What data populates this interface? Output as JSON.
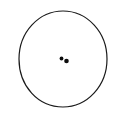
{
  "figure": {
    "type": "line-drawing",
    "background_color": "#ffffff",
    "stroke_color": "#1a1a1a",
    "fill_color": "#0d0d0d",
    "canvas": {
      "width": 123,
      "height": 117
    },
    "outline": {
      "name": "circle-outline",
      "shape": "circle",
      "center_x": 63,
      "center_y": 59,
      "radius_x": 44,
      "radius_y": 48,
      "stroke_width": 1.2,
      "fill": "none",
      "hand_drawn": true,
      "path": "M 63 11 C 87 11 107 32 107 59 C 107 86 87 107 63 107 C 38 107 19 86 19 59 C 19 32 39 11 63 11 Z"
    },
    "dots": [
      {
        "name": "dot-left",
        "center_x": 61.5,
        "center_y": 58.5,
        "radius": 1.9,
        "color": "#0d0d0d"
      },
      {
        "name": "dot-right",
        "center_x": 66.5,
        "center_y": 61.0,
        "radius": 2.3,
        "color": "#0d0d0d"
      }
    ]
  }
}
